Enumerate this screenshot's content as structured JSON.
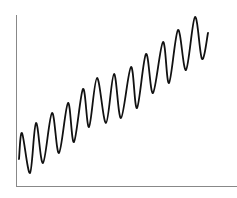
{
  "chart_data": {
    "type": "line",
    "title": "",
    "xlabel": "",
    "ylabel": "",
    "grid": false,
    "legend": null,
    "axes": {
      "x_ticks": [],
      "y_ticks": [],
      "y_axis_visible": true,
      "x_axis_visible": true
    },
    "series": [
      {
        "name": "signal",
        "color": "#111111",
        "x": [
          0,
          3,
          11,
          17,
          24,
          33,
          40,
          49,
          55,
          64,
          70,
          78,
          87,
          95,
          102,
          112,
          118,
          127,
          134,
          144,
          150,
          159,
          167,
          176,
          183,
          189
        ],
        "values": [
          27,
          53,
          13,
          63,
          23,
          73,
          33,
          83,
          44,
          97,
          59,
          108,
          63,
          112,
          68,
          119,
          78,
          132,
          93,
          144,
          103,
          156,
          116,
          169,
          127,
          153
        ]
      }
    ],
    "xlim": [
      0,
      218
    ],
    "ylim": [
      0,
      171
    ]
  },
  "layout": {
    "origin_px": [
      19,
      186
    ],
    "axis_color": "#888888",
    "y_axis": {
      "x": 16,
      "y_top": 15,
      "y_bottom": 186
    },
    "x_axis": {
      "y": 186,
      "x_left": 16,
      "x_right": 237
    }
  }
}
